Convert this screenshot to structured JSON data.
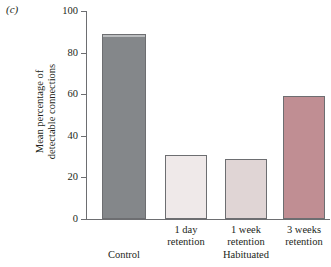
{
  "panel": {
    "label": "(c)"
  },
  "chart_data": {
    "type": "bar",
    "title": "",
    "xlabel": "",
    "ylabel": "Mean percentage of detectable connections",
    "ylabel_lines": [
      "Mean percentage of",
      "detectable connections"
    ],
    "ylim": [
      0,
      100
    ],
    "yticks": [
      0,
      20,
      40,
      60,
      80,
      100
    ],
    "ytick_labels": [
      "0",
      "20",
      "40",
      "60",
      "80",
      "100"
    ],
    "grid": false,
    "legend": "none",
    "categories": [
      "Control",
      "1 day retention",
      "1 week retention",
      "3 weeks retention"
    ],
    "category_lines": [
      [
        "Control",
        ""
      ],
      [
        "1 day",
        "retention"
      ],
      [
        "1 week",
        "retention"
      ],
      [
        "3 weeks",
        "retention"
      ]
    ],
    "values": [
      89,
      31,
      29,
      59
    ],
    "bar_colors": [
      "#84878a",
      "#efe9e9",
      "#e0d5d5",
      "#c08e93"
    ],
    "bar_edge_color": "#6d6e71",
    "groups": [
      {
        "label": "Control",
        "categories": [
          "Control"
        ]
      },
      {
        "label": "Habituated",
        "categories": [
          "1 day retention",
          "1 week retention",
          "3 weeks retention"
        ]
      }
    ],
    "group_labels": [
      "Control",
      "Habituated"
    ]
  }
}
